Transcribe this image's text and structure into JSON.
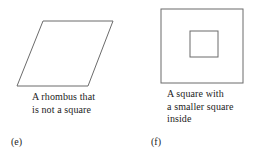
{
  "page": {
    "background_color": "#ffffff",
    "stroke_color": "#6b6b6b",
    "text_color": "#1c1c1c",
    "width": 253,
    "height": 160
  },
  "figures": [
    {
      "id": "e",
      "part_label": "(e)",
      "caption": "A rhombus that\nis not a square",
      "shape": {
        "name": "rhombus",
        "type": "polygon",
        "points": "43,21 113,21 88,86 17,86",
        "vertices": [
          {
            "x": 43,
            "y": 21
          },
          {
            "x": 113,
            "y": 21
          },
          {
            "x": 88,
            "y": 86
          },
          {
            "x": 17,
            "y": 86
          }
        ],
        "fill": "none",
        "stroke": "#6b6b6b",
        "stroke_width": 1
      }
    },
    {
      "id": "f",
      "part_label": "(f)",
      "caption": "A square with\na smaller square\ninside",
      "shape": {
        "name": "nested-squares",
        "type": "rects",
        "outer": {
          "x": 21,
          "y": 9,
          "width": 82,
          "height": 74
        },
        "inner": {
          "x": 50,
          "y": 31,
          "width": 28,
          "height": 26
        },
        "fill": "none",
        "stroke": "#6b6b6b",
        "stroke_width": 1
      }
    }
  ]
}
